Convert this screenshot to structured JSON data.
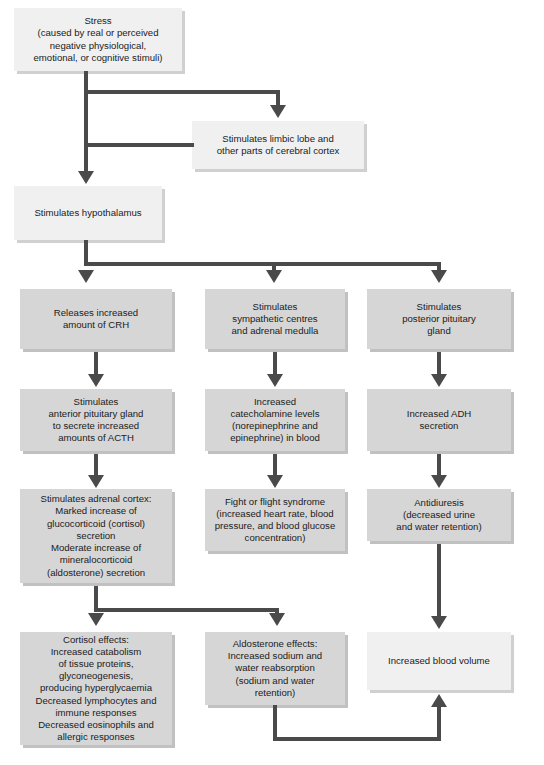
{
  "diagram": {
    "colors": {
      "box_fill": "#d6d6d6",
      "box_fill_light": "#f0f0f0",
      "box_shadow": "#bebebe",
      "connector": "#4a4a4a",
      "text": "#1b1b1b",
      "background": "#ffffff"
    },
    "nodes": {
      "stress": "Stress\n(caused by real or perceived\nnegative physiological,\nemotional, or cognitive stimuli)",
      "limbic": "Stimulates limbic lobe and\nother parts of cerebral cortex",
      "hypothalamus": "Stimulates hypothalamus",
      "crh": "Releases increased\namount of CRH",
      "sympathetic": "Stimulates\nsympathetic centres\nand adrenal medulla",
      "posterior_pituitary": "Stimulates\nposterior pituitary\ngland",
      "anterior_pituitary": "Stimulates\nanterior pituitary gland\nto secrete increased\namounts of ACTH",
      "catecholamine": "Increased\ncatecholamine levels\n(norepinephrine and\nepinephrine) in blood",
      "adh": "Increased ADH\nsecretion",
      "adrenal_cortex": "Stimulates adrenal cortex:\nMarked increase of\nglucocorticoid (cortisol)\nsecretion\nModerate increase of\nmineralocorticoid\n(aldosterone) secretion",
      "fight_or_flight": "Fight or flight syndrome\n(increased heart rate, blood\npressure, and blood glucose\nconcentration)",
      "antidiuresis": "Antidiuresis\n(decreased urine\nand water retention)",
      "cortisol_effects": "Cortisol effects:\nIncreased catabolism\nof tissue proteins,\nglyconeogenesis,\nproducing hyperglycaemia\nDecreased lymphocytes and\nimmune responses\nDecreased eosinophils and\nallergic responses",
      "aldosterone_effects": "Aldosterone effects:\nIncreased sodium and\nwater reabsorption\n(sodium and water\nretention)",
      "blood_volume": "Increased blood volume"
    },
    "caption": ""
  }
}
